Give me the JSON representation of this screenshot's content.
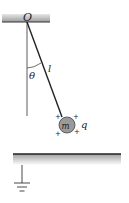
{
  "diagram": {
    "pivot_label": "O",
    "angle_label": "θ",
    "length_label": "l",
    "mass_label": "m",
    "charge_label": "q",
    "charge_sign": "+",
    "colors": {
      "ball_fill": "#9a9a9a",
      "line": "#2a2a2a",
      "ceiling": "#a8a8a8",
      "plate_shade": "#c8c8c8"
    }
  }
}
